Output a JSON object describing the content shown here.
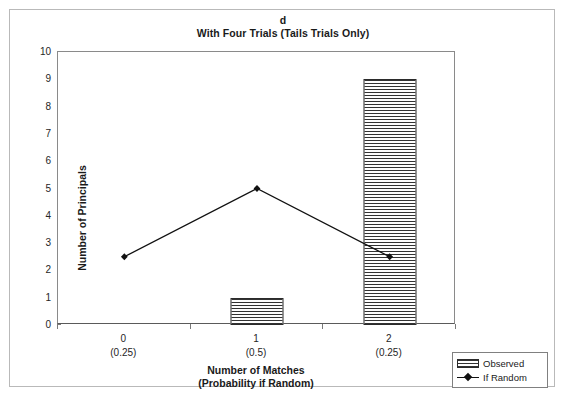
{
  "chart_data": {
    "type": "bar",
    "title": "d",
    "subtitle": "With Four Trials (Tails Trials Only)",
    "xlabel": "Number of Matches",
    "xlabel_line2": "(Probability if Random)",
    "ylabel": "Number of Principals",
    "categories": [
      "0",
      "1",
      "2"
    ],
    "category_sublabels": [
      "(0.25)",
      "(0.5)",
      "(0.25)"
    ],
    "ylim": [
      0,
      10
    ],
    "ytick_step": 1,
    "yticks": [
      "10",
      "9",
      "8",
      "7",
      "6",
      "5",
      "4",
      "3",
      "2",
      "1",
      "0"
    ],
    "grid": false,
    "legend_position": "bottom-right",
    "series": [
      {
        "name": "Observed",
        "type": "bar",
        "values": [
          0,
          1,
          9
        ],
        "fill": "horizontal-hatch",
        "edge_color": "#2b2b2b"
      },
      {
        "name": "If Random",
        "type": "line",
        "values": [
          2.5,
          5,
          2.5
        ],
        "marker": "diamond",
        "line_color": "#111111"
      }
    ]
  },
  "legend": {
    "items": [
      {
        "label": "Observed",
        "swatch": "hatched-bar-swatch"
      },
      {
        "label": "If Random",
        "swatch": "line-marker-swatch"
      }
    ]
  },
  "colors": {
    "background": "#ffffff",
    "outer_frame": "#b9b9b9",
    "axis": "#5a5a5a",
    "text": "#1a1a1a",
    "hatch": "#333333",
    "line": "#111111"
  }
}
